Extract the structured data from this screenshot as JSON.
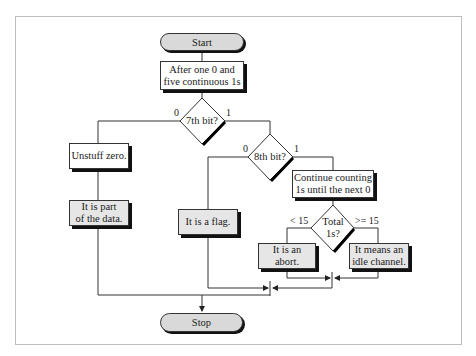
{
  "diagram": {
    "start": "Start",
    "stop": "Stop",
    "step1": {
      "line1": "After one 0 and",
      "line2": "five continuous 1s"
    },
    "decision1": {
      "label": "7th bit?",
      "branch0": "0",
      "branch1": "1"
    },
    "unstuff": "Unstuff zero.",
    "part_of_data": {
      "line1": "It is part",
      "line2": "of the data."
    },
    "decision2": {
      "label": "8th bit?",
      "branch0": "0",
      "branch1": "1"
    },
    "flag": "It is a flag.",
    "continue_counting": {
      "line1": "Continue counting",
      "line2": "1s until the next 0"
    },
    "decision3": {
      "line1": "Total",
      "line2": "1s?",
      "branch_lt": "< 15",
      "branch_ge": ">= 15"
    },
    "abort": {
      "line1": "It is an",
      "line2": "abort."
    },
    "idle": {
      "line1": "It means an",
      "line2": "idle channel."
    }
  },
  "colors": {
    "process_fill": "#ffffff",
    "terminal_fill": "#d9d9d9",
    "result_fill": "#e6e6e6",
    "line": "#333333"
  }
}
